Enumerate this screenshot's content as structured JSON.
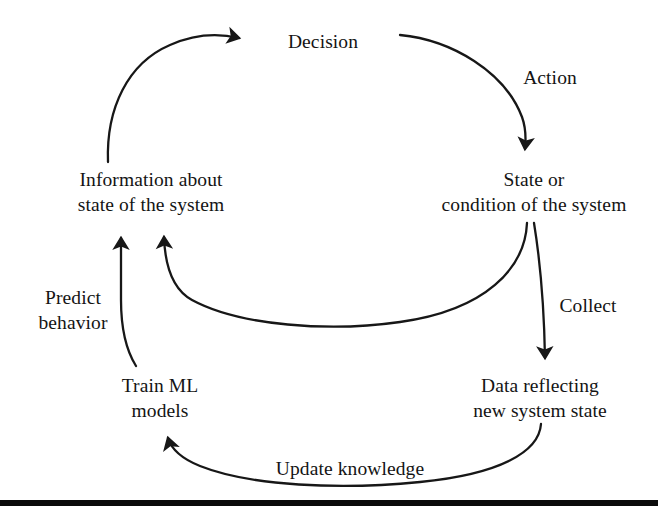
{
  "figure": {
    "type": "cycle-diagram",
    "title": "",
    "background_color": "#ffffff",
    "stroke_color": "#1a1a1a",
    "text_color": "#141414"
  },
  "nodes": [
    {
      "id": "decision",
      "name": "decision-node",
      "lines": [
        "Decision"
      ],
      "center_x": 323,
      "center_y": 41
    },
    {
      "id": "state",
      "name": "state-node",
      "lines": [
        "State or",
        "condition of the system"
      ],
      "center_x": 534,
      "center_y": 192
    },
    {
      "id": "data",
      "name": "data-node",
      "lines": [
        "Data reflecting",
        "new system state"
      ],
      "center_x": 540,
      "center_y": 398
    },
    {
      "id": "train",
      "name": "train-node",
      "lines": [
        "Train ML",
        "models"
      ],
      "center_x": 160,
      "center_y": 398
    },
    {
      "id": "information",
      "name": "information-node",
      "lines": [
        "Information about",
        "state of the system"
      ],
      "center_x": 151,
      "center_y": 192
    }
  ],
  "edges": [
    {
      "id": "action",
      "name": "edge-action",
      "label": "Action",
      "from": "decision",
      "to": "state",
      "label_x": 550,
      "label_y": 77
    },
    {
      "id": "collect",
      "name": "edge-collect",
      "label": "Collect",
      "from": "state",
      "to": "data",
      "label_x": 588,
      "label_y": 305
    },
    {
      "id": "update",
      "name": "edge-update-knowledge",
      "label": "Update knowledge",
      "from": "data",
      "to": "train",
      "label_x": 350,
      "label_y": 468
    },
    {
      "id": "predict",
      "name": "edge-predict-behavior",
      "label": "Predict behavior",
      "label_lines": [
        "Predict",
        "behavior"
      ],
      "from": "train",
      "to": "information",
      "label_x": 73,
      "label_y": 309
    },
    {
      "id": "feedback",
      "name": "edge-state-feedback",
      "label": "",
      "from": "state",
      "to": "information",
      "label_x": 0,
      "label_y": 0
    },
    {
      "id": "decide",
      "name": "edge-information-to-decision",
      "label": "",
      "from": "information",
      "to": "decision",
      "label_x": 0,
      "label_y": 0
    }
  ],
  "footer": {
    "name": "footer-rule",
    "y": 500,
    "height": 6,
    "color": "#0b0b0b"
  }
}
